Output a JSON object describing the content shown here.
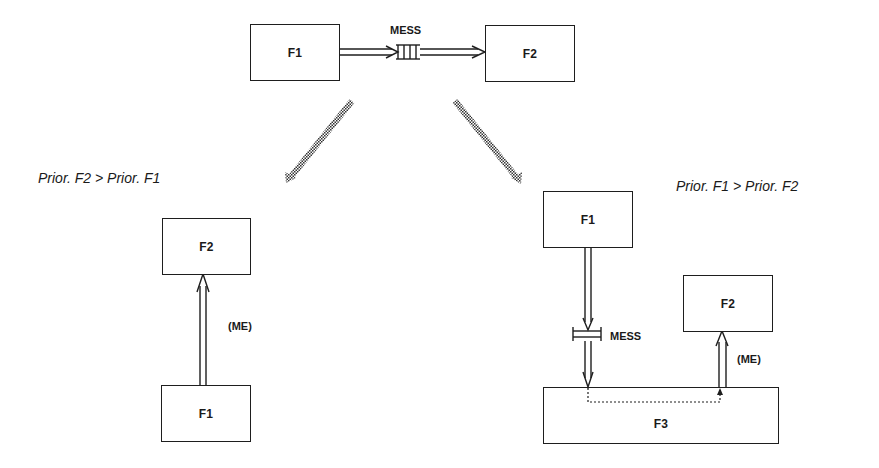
{
  "diagram": {
    "top": {
      "source_box": {
        "label": "F1"
      },
      "target_box": {
        "label": "F2"
      },
      "message_label": "MESS"
    },
    "left_case": {
      "caption": "Prior. F2 > Prior. F1",
      "top_box": {
        "label": "F2"
      },
      "bottom_box": {
        "label": "F1"
      },
      "arrow_label": "(ME)"
    },
    "right_case": {
      "caption": "Prior. F1 > Prior. F2",
      "sender_box": {
        "label": "F1"
      },
      "receiver_box": {
        "label": "F2"
      },
      "handler_box": {
        "label": "F3"
      },
      "message_label": "MESS",
      "arrow_label": "(ME)"
    },
    "colors": {
      "line": "#1e1e1e",
      "background": "#ffffff",
      "dotted_arrow": "#555555"
    }
  }
}
